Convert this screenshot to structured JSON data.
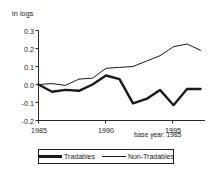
{
  "chart_data": {
    "type": "line",
    "title": "",
    "subtitle": "",
    "xlabel": "",
    "ylabel": "in logs",
    "unit_label": "in logs",
    "annotation": "base year: 1985",
    "x": [
      1985,
      1986,
      1987,
      1988,
      1989,
      1990,
      1991,
      1992,
      1993,
      1994,
      1995,
      1996,
      1997
    ],
    "xlim": [
      1985,
      1997
    ],
    "ylim": [
      -0.2,
      0.3
    ],
    "grid": false,
    "legend_position": "bottom",
    "xticks": [
      1985,
      1990,
      1995
    ],
    "xtick_labels": [
      "1985",
      "1990",
      "1995"
    ],
    "yticks": [
      0.3,
      0.2,
      0.1,
      0.0,
      -0.1,
      -0.2
    ],
    "ytick_labels": [
      "0.3",
      "0.2",
      "0.1",
      "0.0",
      "-0.1",
      "-0.2"
    ],
    "series": [
      {
        "name": "Tradables",
        "style": "thick",
        "color": "#1a1a1a",
        "values": [
          0.0,
          -0.04,
          -0.03,
          -0.035,
          0.0,
          0.05,
          0.03,
          -0.105,
          -0.08,
          -0.03,
          -0.115,
          -0.025,
          -0.025
        ]
      },
      {
        "name": "Non-Tradables",
        "style": "thin",
        "color": "#1a1a1a",
        "values": [
          0.0,
          0.005,
          -0.005,
          0.03,
          0.035,
          0.09,
          0.095,
          0.1,
          0.13,
          0.16,
          0.21,
          0.225,
          0.19
        ]
      }
    ]
  },
  "legend": {
    "items": [
      {
        "label": "Tradables"
      },
      {
        "label": "Non-Tradables"
      }
    ]
  }
}
